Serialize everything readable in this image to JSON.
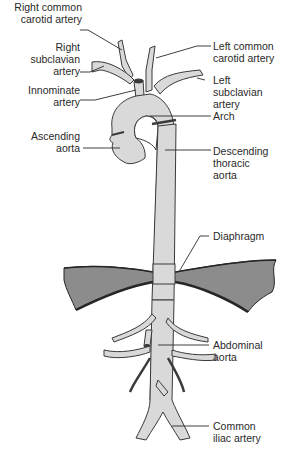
{
  "diagram": {
    "colors": {
      "vessel_fill": "#d9d9d9",
      "vessel_stroke": "#3a3a3a",
      "diaphragm_fill": "#8c8c8c",
      "diaphragm_edge": "#262626",
      "leader_line": "#2a2a2a",
      "text": "#2a2a2a",
      "background": "#ffffff"
    },
    "labels": {
      "right_common_carotid": {
        "line1": "Right common",
        "line2": "carotid artery"
      },
      "right_subclavian": {
        "line1": "Right",
        "line2": "subclavian",
        "line3": "artery"
      },
      "innominate": {
        "line1": "Innominate",
        "line2": "artery"
      },
      "ascending_aorta": {
        "line1": "Ascending",
        "line2": "aorta"
      },
      "left_common_carotid": {
        "line1": "Left common",
        "line2": "carotid artery"
      },
      "left_subclavian": {
        "line1": "Left",
        "line2": "subclavian",
        "line3": "artery"
      },
      "arch": {
        "line1": "Arch"
      },
      "descending_thoracic": {
        "line1": "Descending",
        "line2": "thoracic",
        "line3": "aorta"
      },
      "diaphragm": {
        "line1": "Diaphragm"
      },
      "abdominal_aorta": {
        "line1": "Abdominal",
        "line2": "aorta"
      },
      "common_iliac": {
        "line1": "Common",
        "line2": "iliac artery"
      }
    }
  }
}
